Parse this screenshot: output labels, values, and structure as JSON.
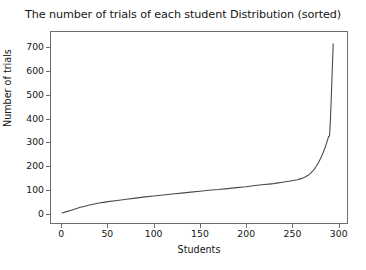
{
  "chart_data": {
    "type": "line",
    "title": "The number of trials of each student Distribution (sorted)",
    "xlabel": "Students",
    "ylabel": "Number of trials",
    "xlim": [
      -12,
      310
    ],
    "ylim": [
      -40,
      765
    ],
    "xticks": [
      0,
      50,
      100,
      150,
      200,
      250,
      300
    ],
    "yticks": [
      0,
      100,
      200,
      300,
      400,
      500,
      600,
      700
    ],
    "xtick_labels": [
      "0",
      "50",
      "100",
      "150",
      "200",
      "250",
      "300"
    ],
    "ytick_labels": [
      "0",
      "100",
      "200",
      "300",
      "400",
      "500",
      "600",
      "700"
    ],
    "grid": false,
    "legend": null,
    "line_color": "#4a4a4a",
    "line_width": 1.1,
    "series": [
      {
        "name": "trials per student (sorted ascending)",
        "x": [
          0,
          5,
          10,
          15,
          20,
          25,
          30,
          35,
          40,
          45,
          50,
          60,
          70,
          80,
          90,
          100,
          110,
          120,
          130,
          140,
          150,
          160,
          170,
          180,
          190,
          200,
          210,
          215,
          220,
          225,
          230,
          235,
          240,
          245,
          250,
          253,
          256,
          259,
          262,
          265,
          268,
          270,
          272,
          274,
          276,
          278,
          280,
          282,
          284,
          286,
          288,
          289,
          290,
          291,
          292,
          293,
          294,
          295
        ],
        "y": [
          2,
          8,
          14,
          20,
          26,
          31,
          36,
          40,
          44,
          47,
          50,
          55,
          60,
          65,
          70,
          74,
          78,
          82,
          86,
          90,
          94,
          98,
          101,
          105,
          109,
          113,
          118,
          120,
          122,
          124,
          126,
          129,
          132,
          135,
          138,
          140,
          142,
          146,
          150,
          155,
          162,
          168,
          176,
          185,
          196,
          208,
          222,
          238,
          256,
          276,
          300,
          312,
          325,
          326,
          400,
          500,
          610,
          715
        ]
      }
    ]
  }
}
